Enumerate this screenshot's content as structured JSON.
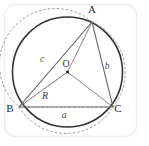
{
  "figure": {
    "panel": {
      "border_color": "#e9e9e9",
      "background_color": "#ffffff"
    },
    "circle": {
      "name": "circumcircle",
      "center_x": 67.5,
      "center_y": 72,
      "radius": 55,
      "stroke_color": "#333333",
      "stroke_width": 1.6
    },
    "center_point": {
      "label": "O",
      "x": 67.5,
      "y": 72,
      "label_x": 63,
      "label_y": 67,
      "dot_color": "#1c1c1c",
      "dot_size": 2.6
    },
    "vertices": [
      {
        "label": "A",
        "x": 92,
        "y": 22,
        "label_x": 92,
        "label_y": 13
      },
      {
        "label": "B",
        "x": 19,
        "y": 107,
        "label_x": 10,
        "label_y": 112
      },
      {
        "label": "C",
        "x": 113,
        "y": 107,
        "label_x": 115,
        "label_y": 112
      }
    ],
    "triangle": {
      "stroke_color": "#6b6b6b",
      "stroke_width": 1.1,
      "fill": "none"
    },
    "radii": [
      {
        "name": "radius-to-A",
        "from": "O",
        "to": "A"
      },
      {
        "name": "radius-to-B",
        "from": "O",
        "to": "B"
      },
      {
        "name": "radius-to-C",
        "from": "O",
        "to": "C"
      }
    ],
    "radius_label": {
      "label": "R",
      "x": 45,
      "y": 98,
      "color": "#3c3c3c"
    },
    "side_labels": [
      {
        "label": "a",
        "side": "BC",
        "x": 64,
        "y": 117,
        "color": "#4a4a4a"
      },
      {
        "label": "b",
        "side": "CA",
        "x": 107,
        "y": 68,
        "color": "#4a4a4a"
      },
      {
        "label": "c",
        "side": "AB",
        "x": 42,
        "y": 61,
        "color": "#4a4a4a"
      }
    ],
    "dashed_arcs": {
      "stroke_color": "#8d8d8d",
      "stroke_width": 0.9,
      "dash_pattern": "2.5,2",
      "items": [
        {
          "name": "arc-a",
          "from": "B",
          "to": "C",
          "label": "a"
        },
        {
          "name": "arc-b",
          "from": "C",
          "to": "A",
          "label": "b"
        },
        {
          "name": "arc-c",
          "from": "A",
          "to": "B",
          "label": "c"
        }
      ]
    },
    "dashed_rays": {
      "stroke_color": "#9a9a9a",
      "stroke_width": 0.8,
      "dash_pattern": "2.5,2",
      "items": [
        {
          "name": "ray-B-to-A",
          "from": "B",
          "to": "A"
        },
        {
          "name": "ray-B-to-C",
          "from": "B",
          "to": "C"
        },
        {
          "name": "ray-B-to-O",
          "from": "B",
          "to": "O"
        }
      ]
    }
  }
}
